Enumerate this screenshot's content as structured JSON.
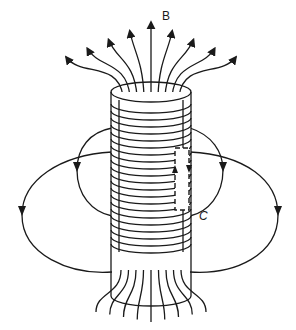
{
  "diagram": {
    "labels": {
      "field": "B",
      "loop": "C"
    },
    "colors": {
      "line": "#1a1a1a",
      "background": "#ffffff"
    },
    "elements": {
      "solenoid": "tightly wound coil (cylinder)",
      "field_lines_top": 9,
      "field_lines_bottom": 9,
      "return_loops_per_side": 2,
      "amperian_loop": "dashed rectangle C straddling the coil wall"
    }
  }
}
